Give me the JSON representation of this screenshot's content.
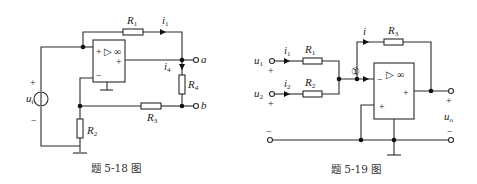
{
  "figures": [
    {
      "id": "fig-5-18",
      "caption": "题 5-18 图",
      "opamp": {
        "infinity": "∞",
        "triangle": "▷",
        "in_plus_top": "+",
        "out_plus": "+",
        "in_minus": "−"
      },
      "source": {
        "label": "u",
        "sub": "i",
        "plus": "+",
        "minus": "−"
      },
      "resistors": [
        {
          "label": "R",
          "sub": "1"
        },
        {
          "label": "R",
          "sub": "2"
        },
        {
          "label": "R",
          "sub": "3"
        },
        {
          "label": "R",
          "sub": "4"
        }
      ],
      "currents": [
        {
          "label": "i",
          "sub": "1"
        },
        {
          "label": "i",
          "sub": "4"
        }
      ],
      "terminals": [
        {
          "label": "a"
        },
        {
          "label": "b"
        }
      ]
    },
    {
      "id": "fig-5-19",
      "caption": "题 5-19 图",
      "opamp": {
        "infinity": "∞",
        "triangle": "▷",
        "in_minus": "−",
        "in_plus": "+",
        "out_plus": "+"
      },
      "node_marker": "①",
      "inputs": [
        {
          "label": "u",
          "sub": "1",
          "polarity": "+"
        },
        {
          "label": "u",
          "sub": "2",
          "polarity": "+"
        }
      ],
      "resistors": [
        {
          "label": "R",
          "sub": "1"
        },
        {
          "label": "R",
          "sub": "2"
        },
        {
          "label": "R",
          "sub": "3"
        }
      ],
      "currents": [
        {
          "label": "i",
          "sub": "1"
        },
        {
          "label": "i",
          "sub": "2"
        },
        {
          "label": "i",
          "sub": ""
        }
      ],
      "output": {
        "label": "u",
        "sub": "o",
        "plus": "+",
        "minus": "−"
      },
      "ground_terminal_minus_left": "−",
      "ground_terminal_minus_right": "−"
    }
  ]
}
